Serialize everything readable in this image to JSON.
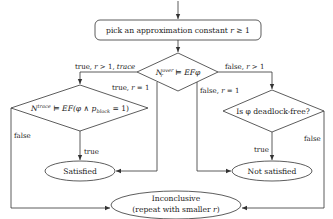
{
  "diagram": {
    "type": "flowchart",
    "nodes": {
      "start": {
        "text_main": "pick an approximation constant ",
        "text_var": "r",
        "text_rest": " ≥ 1"
      },
      "check_over": {
        "text_N": "N",
        "text_sub": "r",
        "text_sup": "over",
        "text_rest": " ⊨ EFφ"
      },
      "check_trace": {
        "text_N": "N",
        "text_sup": "trace",
        "text_rest": " ⊨ EF(φ ∧ p",
        "text_sub": "block",
        "text_end": " = 1)"
      },
      "deadlock": {
        "text": "Is φ deadlock-free?"
      },
      "satisfied": {
        "text": "Satisfied"
      },
      "not_satisfied": {
        "text": "Not satisfied"
      },
      "inconclusive": {
        "line1": "Inconclusive",
        "line2_pre": "(repeat with smaller ",
        "line2_var": "r",
        "line2_post": ")"
      }
    },
    "edges": {
      "true_r_gt1_trace": {
        "pre": "true, ",
        "var": "r",
        "mid": " > 1, ",
        "tail": "trace"
      },
      "false_r_gt1": {
        "pre": "false, ",
        "var": "r",
        "tail": " > 1"
      },
      "true_r_eq1": {
        "pre": "true, ",
        "var": "r",
        "tail": " = 1"
      },
      "false_r_eq1": {
        "pre": "false, ",
        "var": "r",
        "tail": " = 1"
      },
      "trace_false": "false",
      "trace_true": "true",
      "deadlock_true": "true",
      "deadlock_false": "false"
    }
  }
}
